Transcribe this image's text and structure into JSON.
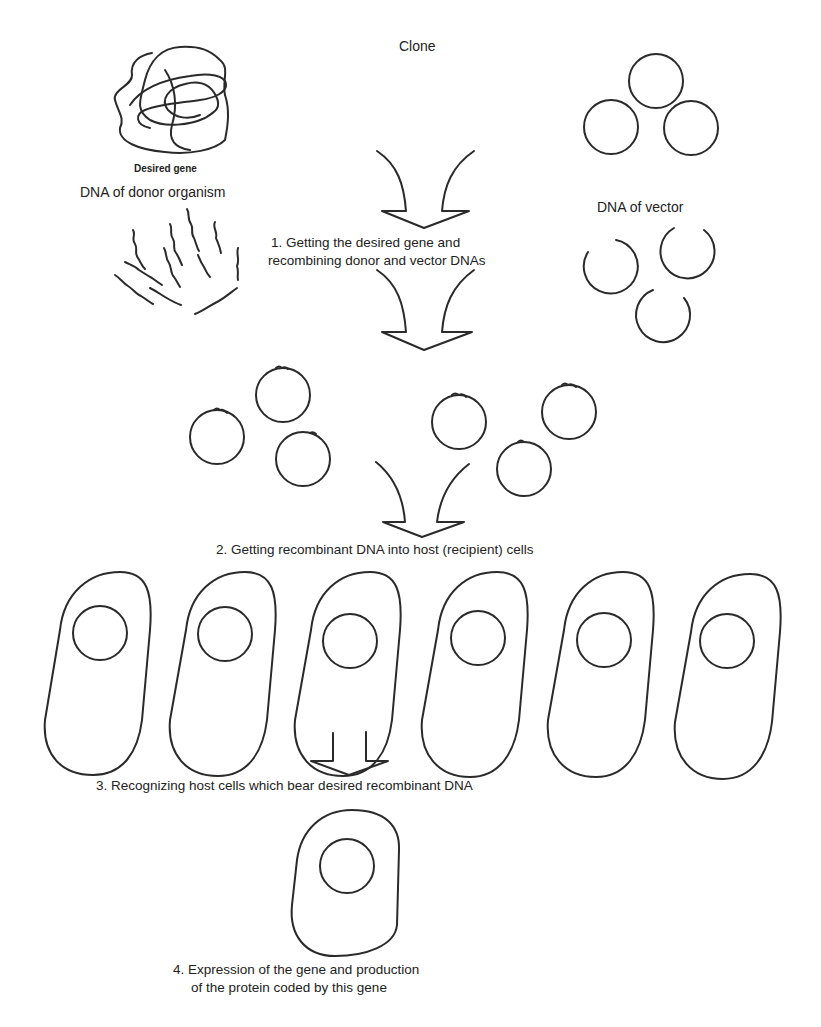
{
  "diagram": {
    "title": "Clone",
    "labels": {
      "desired_gene": "Desired gene",
      "donor_dna": "DNA of donor organism",
      "vector_dna": "DNA of vector"
    },
    "steps": [
      {
        "number": "1.",
        "line1": "1. Getting the desired gene and",
        "line2": "recombining donor and vector DNAs"
      },
      {
        "number": "2.",
        "line1": "2. Getting recombinant DNA into host (recipient) cells"
      },
      {
        "number": "3.",
        "line1": "3. Recognizing host cells which bear desired recombinant DNA"
      },
      {
        "number": "4.",
        "line1": "4. Expression of the gene and production",
        "line2": "of the protein coded by this gene"
      }
    ],
    "elements": {
      "donor_tangle": "tangled-dna-coil-icon",
      "donor_fragments": "dna-fragments-icon",
      "vector_plasmids_count": 3,
      "cut_plasmids_count": 3,
      "recombinant_plasmids_count": 6,
      "host_cells_count": 6,
      "selected_cells_count": 1
    },
    "colors": {
      "ink": "#2a2a2a",
      "background": "#ffffff"
    }
  }
}
